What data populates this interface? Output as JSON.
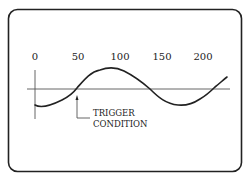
{
  "diagram": {
    "title": "",
    "axis": {
      "tick_labels": [
        "0",
        "50",
        "100",
        "150",
        "200"
      ]
    },
    "annotation": {
      "line1": "TRIGGER",
      "line2": "CONDITION"
    },
    "colors": {
      "stroke": "#222222",
      "axis": "#555555",
      "background": "#ffffff"
    }
  }
}
